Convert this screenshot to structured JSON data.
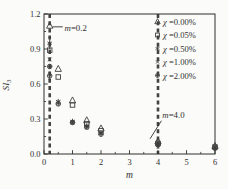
{
  "figure": {
    "background": "#fbfbf9",
    "ink": "#2f2f2f",
    "mark_ink": "#3f3f3f",
    "guide_ink": "#434343"
  },
  "chart_data": {
    "type": "scatter",
    "title": "",
    "xlabel": "m",
    "ylabel": "SI",
    "ylabel_sub": "3",
    "xlim": [
      0,
      6
    ],
    "ylim": [
      0,
      1.2
    ],
    "xticks": [
      0,
      1,
      2,
      3,
      4,
      5,
      6
    ],
    "xtick_labels": [
      "0",
      "1",
      "2",
      "3",
      "4",
      "5",
      "6"
    ],
    "yticks": [
      0.0,
      0.3,
      0.6,
      0.9,
      1.2
    ],
    "ytick_labels": [
      "0.0",
      "0.3",
      "0.6",
      "0.9",
      "1.2"
    ],
    "xminor_step": 0.5,
    "yminor_step": 0.15,
    "grid": false,
    "legend_position": "upper-right",
    "series": [
      {
        "name": "χ =0.00%",
        "symbol": "triangle-open",
        "points": [
          [
            0.2,
            1.1
          ],
          [
            0.5,
            0.73
          ],
          [
            1,
            0.46
          ],
          [
            1.5,
            0.29
          ],
          [
            2,
            0.22
          ],
          [
            4,
            0.11
          ],
          [
            6,
            0.07
          ]
        ]
      },
      {
        "name": "χ =0.05%",
        "symbol": "square-open",
        "points": [
          [
            0.2,
            0.89
          ],
          [
            0.5,
            0.66
          ],
          [
            1,
            0.42
          ],
          [
            1.5,
            0.26
          ],
          [
            2,
            0.2
          ],
          [
            4,
            0.09
          ],
          [
            6,
            0.06
          ]
        ]
      },
      {
        "name": "χ =0.50%",
        "symbol": "asterisk",
        "points": [
          [
            0.2,
            0.95,
            0.05
          ],
          [
            0.5,
            0.45
          ],
          [
            1,
            0.28
          ],
          [
            1.5,
            0.24
          ],
          [
            2,
            0.18
          ],
          [
            4,
            0.09
          ],
          [
            6,
            0.06
          ]
        ]
      },
      {
        "name": "χ =1.00%",
        "symbol": "x-cross",
        "points": [
          [
            0.2,
            0.81
          ],
          [
            0.5,
            0.44
          ],
          [
            1,
            0.27
          ],
          [
            1.5,
            0.23
          ],
          [
            2,
            0.18
          ],
          [
            4,
            0.08
          ],
          [
            6,
            0.05
          ]
        ]
      },
      {
        "name": "χ =2.00%",
        "symbol": "circle-plus",
        "points": [
          [
            0.2,
            0.75
          ],
          [
            0.2,
            0.67,
            0.03
          ],
          [
            0.5,
            0.43
          ],
          [
            1,
            0.27
          ],
          [
            1.5,
            0.23
          ],
          [
            2,
            0.17
          ],
          [
            4,
            0.08,
            0.03
          ],
          [
            6,
            0.05
          ]
        ]
      }
    ],
    "guides": [
      {
        "axis": "x",
        "value": 0.2,
        "style": "dashed"
      },
      {
        "axis": "x",
        "value": 4.0,
        "style": "dashed"
      }
    ],
    "annotations": [
      {
        "italic_prefix": "m",
        "suffix": "=0.2",
        "text_x": 0.72,
        "text_y": 1.055,
        "line": [
          0.3,
          1.09,
          0.66,
          1.09
        ]
      },
      {
        "italic_prefix": "m",
        "suffix": "=4.0",
        "text_x": 4.15,
        "text_y": 0.31,
        "line": [
          3.72,
          0.13,
          4.12,
          0.285
        ]
      }
    ]
  }
}
